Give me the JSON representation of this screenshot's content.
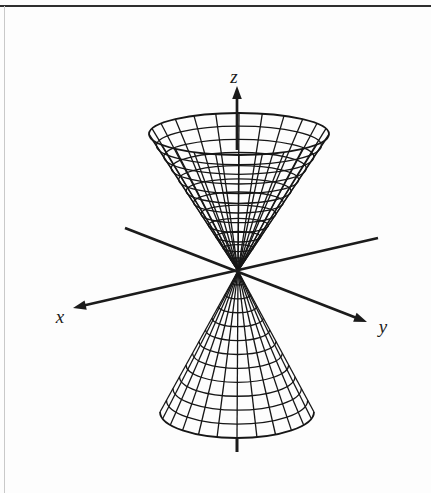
{
  "figure": {
    "axis_labels": {
      "x": "x",
      "y": "y",
      "z": "z"
    }
  },
  "diagram": {
    "apex": [
      238,
      271
    ],
    "upper_cone": {
      "rim_center": [
        239,
        134
      ],
      "rx": 90,
      "ry": 21,
      "rings": 12,
      "segments": 24
    },
    "lower_cone": {
      "rim_center": [
        237,
        412
      ],
      "rx": 77,
      "ry": 26,
      "rings": 12,
      "segments": 24
    },
    "axes": {
      "x": {
        "from": [
          378,
          238
        ],
        "tip": [
          73,
          308
        ]
      },
      "y": {
        "from": [
          125,
          228
        ],
        "tip": [
          367,
          322
        ]
      },
      "z": {
        "from": [
          237,
          150
        ],
        "tip": [
          237,
          86
        ]
      },
      "z_stub": {
        "from": [
          237,
          439
        ],
        "to": [
          237,
          452
        ]
      }
    }
  },
  "style": {
    "ink": "#1b1b1b",
    "mesh_color": "#161616",
    "mesh_width": 1.3,
    "rim_width": 1.8,
    "axis_width": 2.7,
    "frame_top_color": "#2e2e2e",
    "frame_left_color": "#c9c9c9",
    "background": "#fdfdfd"
  }
}
